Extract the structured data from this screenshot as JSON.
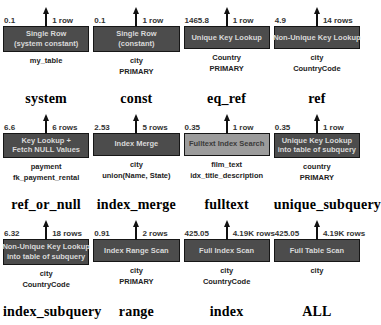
{
  "diagram_title": "MySQL EXPLAIN access types (visual explain)",
  "colors": {
    "background": "#ffffff",
    "box_dark_fill": "#4c4c4c",
    "box_dark_text": "#d9d9d9",
    "box_light_fill": "#9c9c9c",
    "box_light_text": "#3a3a3a",
    "box_border": "#161616",
    "arrow": "#111111",
    "label_text": "#000000"
  },
  "cells": [
    {
      "cost": "0.1",
      "rows": "1 row",
      "box_lines": [
        "Single Row",
        "(system constant)"
      ],
      "table": "my_table",
      "key": "",
      "label": "system",
      "variant": "dark"
    },
    {
      "cost": "0.1",
      "rows": "1 row",
      "box_lines": [
        "Single Row",
        "(constant)"
      ],
      "table": "city",
      "key": "PRIMARY",
      "label": "const",
      "variant": "dark"
    },
    {
      "cost": "1465.8",
      "rows": "1 row",
      "box_lines": [
        "Unique Key Lookup"
      ],
      "table": "Country",
      "key": "PRIMARY",
      "label": "eq_ref",
      "variant": "dark"
    },
    {
      "cost": "4.9",
      "rows": "14 rows",
      "box_lines": [
        "Non-Unique Key Lookup"
      ],
      "table": "city",
      "key": "CountryCode",
      "label": "ref",
      "variant": "dark"
    },
    {
      "cost": "6.6",
      "rows": "6 rows",
      "box_lines": [
        "Key Lookup +",
        "Fetch NULL Values"
      ],
      "table": "payment",
      "key": "fk_payment_rental",
      "label": "ref_or_null",
      "variant": "dark"
    },
    {
      "cost": "2.53",
      "rows": "5 rows",
      "box_lines": [
        "Index Merge"
      ],
      "table": "city",
      "key": "union(Name, State)",
      "label": "index_merge",
      "variant": "dark"
    },
    {
      "cost": "0.35",
      "rows": "1 row",
      "box_lines": [
        "Fulltext Index Search"
      ],
      "table": "film_text",
      "key": "idx_title_description",
      "label": "fulltext",
      "variant": "light"
    },
    {
      "cost": "0.35",
      "rows": "1 row",
      "box_lines": [
        "Unique Key Lookup",
        "into table of subquery"
      ],
      "table": "country",
      "key": "PRIMARY",
      "label": "unique_subquery",
      "variant": "dark"
    },
    {
      "cost": "6.32",
      "rows": "18 rows",
      "box_lines": [
        "Non-Unique Key Lookup",
        "into table of subquery"
      ],
      "table": "city",
      "key": "CountryCode",
      "label": "index_subquery",
      "variant": "dark"
    },
    {
      "cost": "0.91",
      "rows": "2 rows",
      "box_lines": [
        "Index Range Scan"
      ],
      "table": "city",
      "key": "PRIMARY",
      "label": "range",
      "variant": "dark"
    },
    {
      "cost": "425.05",
      "rows": "4.19K rows",
      "box_lines": [
        "Full Index Scan"
      ],
      "table": "city",
      "key": "CountryCode",
      "label": "index",
      "variant": "dark"
    },
    {
      "cost": "425.05",
      "rows": "4.19K rows",
      "box_lines": [
        "Full Table Scan"
      ],
      "table": "city",
      "key": "",
      "label": "ALL",
      "variant": "dark"
    }
  ]
}
